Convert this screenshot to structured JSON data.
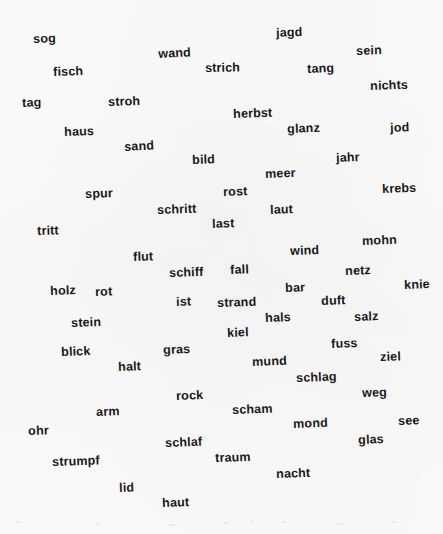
{
  "page": {
    "kind": "scanned-word-scatter",
    "width": 443,
    "height": 534,
    "background_color": "#fdfdfd",
    "text_color": "#18181a",
    "language": "German",
    "word_count": 71
  },
  "words": [
    {
      "text": "sog",
      "x": 33,
      "y": 33,
      "rot": -2,
      "size": 12.5
    },
    {
      "text": "jagd",
      "x": 276,
      "y": 27,
      "rot": -2,
      "size": 12.5
    },
    {
      "text": "wand",
      "x": 158,
      "y": 48,
      "rot": -3,
      "size": 12.5
    },
    {
      "text": "sein",
      "x": 356,
      "y": 45,
      "rot": -2,
      "size": 12.5
    },
    {
      "text": "fisch",
      "x": 53,
      "y": 66,
      "rot": -2,
      "size": 12.5
    },
    {
      "text": "strich",
      "x": 205,
      "y": 62,
      "rot": -1,
      "size": 12.5
    },
    {
      "text": "tang",
      "x": 307,
      "y": 63,
      "rot": -2,
      "size": 12.5
    },
    {
      "text": "nichts",
      "x": 370,
      "y": 80,
      "rot": -2,
      "size": 12.5
    },
    {
      "text": "tag",
      "x": 22,
      "y": 97,
      "rot": -2,
      "size": 12.5
    },
    {
      "text": "stroh",
      "x": 108,
      "y": 96,
      "rot": -2,
      "size": 12.5
    },
    {
      "text": "herbst",
      "x": 233,
      "y": 108,
      "rot": -2,
      "size": 12.5
    },
    {
      "text": "glanz",
      "x": 287,
      "y": 123,
      "rot": -2,
      "size": 12.5
    },
    {
      "text": "jod",
      "x": 390,
      "y": 122,
      "rot": -2,
      "size": 12.5
    },
    {
      "text": "haus",
      "x": 64,
      "y": 126,
      "rot": -2,
      "size": 12.5
    },
    {
      "text": "sand",
      "x": 124,
      "y": 141,
      "rot": -3,
      "size": 12.5
    },
    {
      "text": "bild",
      "x": 192,
      "y": 154,
      "rot": -2,
      "size": 12.5
    },
    {
      "text": "jahr",
      "x": 336,
      "y": 152,
      "rot": -2,
      "size": 12.5
    },
    {
      "text": "meer",
      "x": 265,
      "y": 168,
      "rot": -2,
      "size": 12.5
    },
    {
      "text": "spur",
      "x": 85,
      "y": 188,
      "rot": -2,
      "size": 12.5
    },
    {
      "text": "rost",
      "x": 223,
      "y": 186,
      "rot": -2,
      "size": 12.5
    },
    {
      "text": "krebs",
      "x": 382,
      "y": 183,
      "rot": -2,
      "size": 12.5
    },
    {
      "text": "schritt",
      "x": 157,
      "y": 204,
      "rot": -2,
      "size": 12.5
    },
    {
      "text": "laut",
      "x": 270,
      "y": 204,
      "rot": -2,
      "size": 12.5
    },
    {
      "text": "last",
      "x": 212,
      "y": 218,
      "rot": -2,
      "size": 12.5
    },
    {
      "text": "tritt",
      "x": 37,
      "y": 225,
      "rot": -2,
      "size": 12.5
    },
    {
      "text": "wind",
      "x": 290,
      "y": 245,
      "rot": -2,
      "size": 12.5
    },
    {
      "text": "mohn",
      "x": 362,
      "y": 235,
      "rot": -2,
      "size": 12.5
    },
    {
      "text": "flut",
      "x": 133,
      "y": 251,
      "rot": -2,
      "size": 12.5
    },
    {
      "text": "schiff",
      "x": 169,
      "y": 267,
      "rot": -2,
      "size": 12.5
    },
    {
      "text": "fall",
      "x": 230,
      "y": 264,
      "rot": -2,
      "size": 12.5
    },
    {
      "text": "netz",
      "x": 345,
      "y": 265,
      "rot": -2,
      "size": 12.5
    },
    {
      "text": "knie",
      "x": 404,
      "y": 279,
      "rot": -2,
      "size": 12.5
    },
    {
      "text": "holz",
      "x": 50,
      "y": 285,
      "rot": -2,
      "size": 12.5
    },
    {
      "text": "rot",
      "x": 95,
      "y": 286,
      "rot": -2,
      "size": 12.5
    },
    {
      "text": "bar",
      "x": 285,
      "y": 282,
      "rot": -2,
      "size": 12.5
    },
    {
      "text": "ist",
      "x": 176,
      "y": 296,
      "rot": -2,
      "size": 12.5
    },
    {
      "text": "strand",
      "x": 217,
      "y": 297,
      "rot": -2,
      "size": 12.5
    },
    {
      "text": "duft",
      "x": 321,
      "y": 295,
      "rot": -2,
      "size": 12.5
    },
    {
      "text": "stein",
      "x": 71,
      "y": 317,
      "rot": -2,
      "size": 12.5
    },
    {
      "text": "hals",
      "x": 265,
      "y": 312,
      "rot": -2,
      "size": 12.5
    },
    {
      "text": "salz",
      "x": 354,
      "y": 311,
      "rot": -2,
      "size": 12.5
    },
    {
      "text": "kiel",
      "x": 227,
      "y": 327,
      "rot": -2,
      "size": 12.5
    },
    {
      "text": "fuss",
      "x": 331,
      "y": 338,
      "rot": -2,
      "size": 12.5
    },
    {
      "text": "blick",
      "x": 61,
      "y": 346,
      "rot": -2,
      "size": 12.5
    },
    {
      "text": "gras",
      "x": 163,
      "y": 344,
      "rot": -2,
      "size": 12.5
    },
    {
      "text": "ziel",
      "x": 380,
      "y": 351,
      "rot": -2,
      "size": 12.5
    },
    {
      "text": "halt",
      "x": 118,
      "y": 361,
      "rot": -2,
      "size": 12.5
    },
    {
      "text": "mund",
      "x": 252,
      "y": 356,
      "rot": -2,
      "size": 12.5
    },
    {
      "text": "schlag",
      "x": 296,
      "y": 372,
      "rot": -2,
      "size": 12.5
    },
    {
      "text": "rock",
      "x": 176,
      "y": 390,
      "rot": -2,
      "size": 12.5
    },
    {
      "text": "weg",
      "x": 362,
      "y": 387,
      "rot": -2,
      "size": 12.5
    },
    {
      "text": "scham",
      "x": 232,
      "y": 404,
      "rot": -2,
      "size": 12.5
    },
    {
      "text": "arm",
      "x": 96,
      "y": 406,
      "rot": -2,
      "size": 12.5
    },
    {
      "text": "mond",
      "x": 293,
      "y": 418,
      "rot": -2,
      "size": 12.5
    },
    {
      "text": "see",
      "x": 398,
      "y": 415,
      "rot": -2,
      "size": 12.5
    },
    {
      "text": "ohr",
      "x": 28,
      "y": 425,
      "rot": -2,
      "size": 12.5
    },
    {
      "text": "schlaf",
      "x": 165,
      "y": 437,
      "rot": -2,
      "size": 12.5
    },
    {
      "text": "glas",
      "x": 358,
      "y": 434,
      "rot": -2,
      "size": 12.5
    },
    {
      "text": "strumpf",
      "x": 52,
      "y": 456,
      "rot": -2,
      "size": 12.5
    },
    {
      "text": "traum",
      "x": 215,
      "y": 452,
      "rot": -2,
      "size": 12.5
    },
    {
      "text": "nacht",
      "x": 276,
      "y": 468,
      "rot": -2,
      "size": 12.5
    },
    {
      "text": "lid",
      "x": 119,
      "y": 482,
      "rot": -2,
      "size": 12.5
    },
    {
      "text": "haut",
      "x": 162,
      "y": 497,
      "rot": -2,
      "size": 12.5
    }
  ]
}
